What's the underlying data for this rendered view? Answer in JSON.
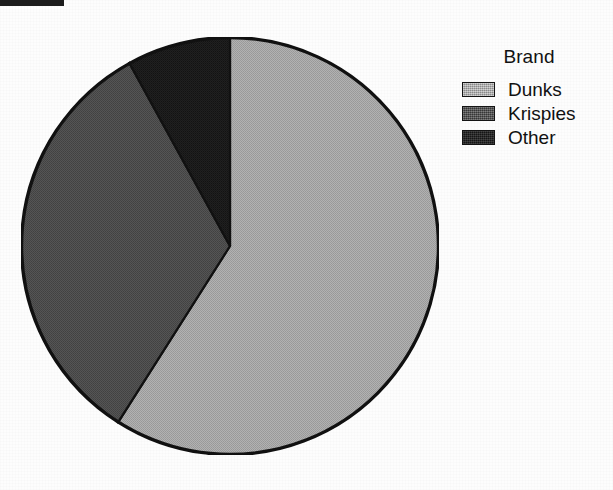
{
  "figure": {
    "background_color": "#fdfdfd",
    "scan_artifact": {
      "present": true,
      "color": "#1c1c1c"
    }
  },
  "legend": {
    "title": "Brand",
    "position": "right",
    "entries": [
      {
        "label": "Dunks",
        "color": "#a9a9a9",
        "tone": "light"
      },
      {
        "label": "Krispies",
        "color": "#4c4c4c",
        "tone": "mid"
      },
      {
        "label": "Other",
        "color": "#1b1b1b",
        "tone": "dark"
      }
    ]
  },
  "chart_data": {
    "type": "pie",
    "title": "",
    "legend_title": "Brand",
    "legend_position": "right",
    "grid": false,
    "start_angle_deg": 0,
    "direction": "clockwise",
    "center_px": [
      230,
      246
    ],
    "radius_px": 209,
    "labels": [
      "Dunks",
      "Krispies",
      "Other"
    ],
    "values": [
      59,
      33,
      8
    ],
    "percentages": [
      59,
      33,
      8
    ],
    "angles_deg": [
      212.4,
      118.8,
      28.8
    ],
    "colors": [
      "#a9a9a9",
      "#4c4c4c",
      "#1b1b1b"
    ],
    "slices": [
      {
        "label": "Dunks",
        "value": 59,
        "percent": 59,
        "start_deg": 0,
        "end_deg": 212.4,
        "color": "#a9a9a9"
      },
      {
        "label": "Krispies",
        "value": 33,
        "percent": 33,
        "start_deg": 212.4,
        "end_deg": 331.2,
        "color": "#4c4c4c"
      },
      {
        "label": "Other",
        "value": 8,
        "percent": 8,
        "start_deg": 331.2,
        "end_deg": 360,
        "color": "#1b1b1b"
      }
    ],
    "xlabel": "",
    "ylabel": ""
  }
}
